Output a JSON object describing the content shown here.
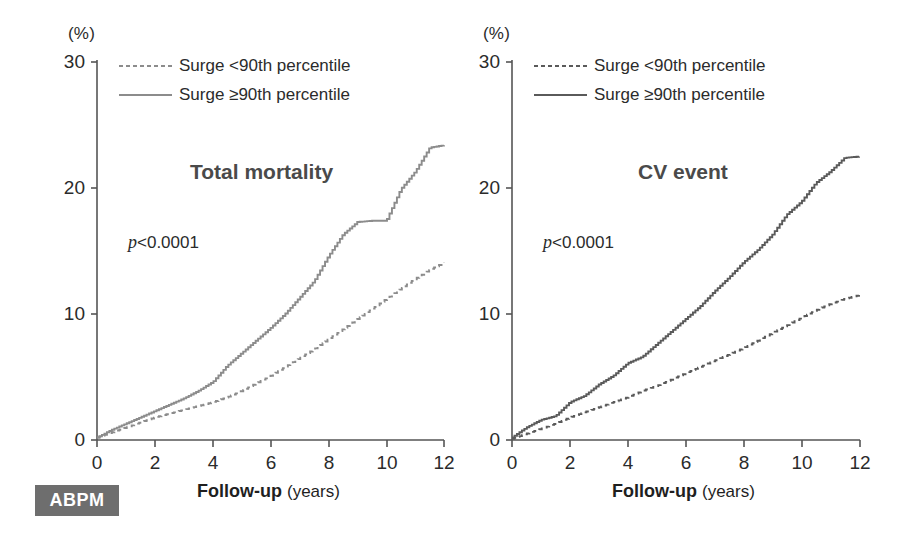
{
  "badge": {
    "label": "ABPM"
  },
  "panels": [
    {
      "id": "total-mortality",
      "title": "Total mortality",
      "pvalue_italic": "p",
      "pvalue_rest": "<0.0001",
      "y_unit": "(%)",
      "x_title_bold": "Follow-up",
      "x_title_light": "(years)",
      "line_color": "#8c8c8c",
      "legend": [
        {
          "label": "Surge <90th percentile",
          "style": "dashed"
        },
        {
          "label": "Surge ≥90th percentile",
          "style": "solid"
        }
      ]
    },
    {
      "id": "cv-event",
      "title": "CV event",
      "pvalue_italic": "p",
      "pvalue_rest": "<0.0001",
      "y_unit": "(%)",
      "x_title_bold": "Follow-up",
      "x_title_light": "(years)",
      "line_color": "#5a5a5a",
      "legend": [
        {
          "label": "Surge <90th percentile",
          "style": "dashed"
        },
        {
          "label": "Surge ≥90th percentile",
          "style": "solid"
        }
      ]
    }
  ],
  "chart_data": [
    {
      "type": "line",
      "title": "Total mortality",
      "xlabel": "Follow-up (years)",
      "ylabel": "(%)",
      "xlim": [
        0,
        12
      ],
      "ylim": [
        0,
        30
      ],
      "xticks": [
        0,
        2,
        4,
        6,
        8,
        10,
        12
      ],
      "yticks": [
        0,
        10,
        20,
        30
      ],
      "grid": false,
      "legend_position": "top-left",
      "annotation": "p<0.0001",
      "series": [
        {
          "name": "Surge <90th percentile",
          "style": "dashed",
          "x": [
            0,
            0.5,
            1,
            1.5,
            2,
            2.5,
            3,
            3.5,
            4,
            4.5,
            5,
            5.5,
            6,
            6.5,
            7,
            7.5,
            8,
            8.5,
            9,
            9.5,
            10,
            10.5,
            11,
            11.5,
            12
          ],
          "y": [
            0.2,
            0.6,
            1.0,
            1.4,
            1.8,
            2.1,
            2.4,
            2.7,
            3.0,
            3.4,
            3.9,
            4.5,
            5.1,
            5.8,
            6.5,
            7.2,
            8.0,
            8.8,
            9.6,
            10.4,
            11.2,
            12.0,
            12.8,
            13.5,
            14.1
          ]
        },
        {
          "name": "Surge ≥90th percentile",
          "style": "solid",
          "x": [
            0,
            0.5,
            1,
            1.5,
            2,
            2.5,
            3,
            3.5,
            4,
            4.5,
            5,
            5.5,
            6,
            6.5,
            7,
            7.5,
            8,
            8.5,
            9,
            9.5,
            10,
            10.5,
            11,
            11.5,
            12
          ],
          "y": [
            0.2,
            0.8,
            1.3,
            1.8,
            2.3,
            2.8,
            3.3,
            3.9,
            4.6,
            5.9,
            6.9,
            7.9,
            8.9,
            10.0,
            11.3,
            12.6,
            14.6,
            16.3,
            17.3,
            17.4,
            17.4,
            19.9,
            21.3,
            23.2,
            23.4
          ]
        }
      ]
    },
    {
      "type": "line",
      "title": "CV event",
      "xlabel": "Follow-up (years)",
      "ylabel": "(%)",
      "xlim": [
        0,
        12
      ],
      "ylim": [
        0,
        30
      ],
      "xticks": [
        0,
        2,
        4,
        6,
        8,
        10,
        12
      ],
      "yticks": [
        0,
        10,
        20,
        30
      ],
      "grid": false,
      "legend_position": "top-left",
      "annotation": "p<0.0001",
      "series": [
        {
          "name": "Surge <90th percentile",
          "style": "dashed",
          "x": [
            0,
            0.5,
            1,
            1.5,
            2,
            2.5,
            3,
            3.5,
            4,
            4.5,
            5,
            5.5,
            6,
            6.5,
            7,
            7.5,
            8,
            8.5,
            9,
            9.5,
            10,
            10.5,
            11,
            11.5,
            12
          ],
          "y": [
            0.1,
            0.5,
            0.9,
            1.3,
            1.8,
            2.2,
            2.6,
            3.0,
            3.4,
            3.9,
            4.3,
            4.8,
            5.3,
            5.8,
            6.3,
            6.8,
            7.3,
            7.9,
            8.5,
            9.1,
            9.7,
            10.3,
            10.8,
            11.2,
            11.5
          ]
        },
        {
          "name": "Surge ≥90th percentile",
          "style": "solid",
          "x": [
            0,
            0.5,
            1,
            1.5,
            2,
            2.5,
            3,
            3.5,
            4,
            4.5,
            5,
            5.5,
            6,
            6.5,
            7,
            7.5,
            8,
            8.5,
            9,
            9.5,
            10,
            10.5,
            11,
            11.5,
            12
          ],
          "y": [
            0.2,
            1.0,
            1.6,
            1.9,
            3.0,
            3.5,
            4.4,
            5.1,
            6.1,
            6.6,
            7.6,
            8.6,
            9.6,
            10.6,
            11.8,
            12.9,
            14.1,
            15.1,
            16.3,
            17.9,
            18.9,
            20.4,
            21.3,
            22.4,
            22.5
          ]
        }
      ]
    }
  ]
}
